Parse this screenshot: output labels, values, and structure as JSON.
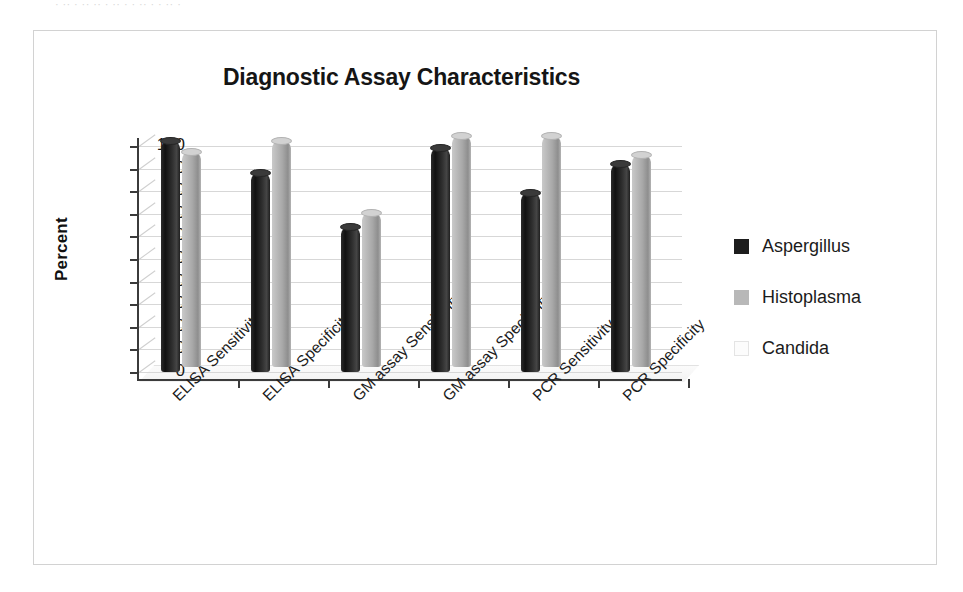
{
  "page": {
    "crumb_text": "· ·· ·  ·· ·· · ·· ·  ·   ·· · ·  ·· ·"
  },
  "chart_data": {
    "type": "bar",
    "title": "Diagnostic Assay Characteristics",
    "xlabel": "",
    "ylabel": "Percent",
    "ylim": [
      0,
      100
    ],
    "yticks": [
      100,
      90,
      80,
      70,
      60,
      50,
      40,
      30,
      20,
      10,
      0
    ],
    "grid": true,
    "legend_position": "right",
    "style": "3d-cylinder",
    "categories": [
      "ELISA Sensitivity",
      "ELISA Specificity",
      "GM assay Sensitivity",
      "GM assay Specificity",
      "PCR Sensitivity",
      "PCR Specificity"
    ],
    "series": [
      {
        "name": "Aspergillus",
        "color": "#1d1d1d",
        "values": [
          102,
          88,
          64,
          99,
          79,
          92
        ]
      },
      {
        "name": "Histoplasma",
        "color": "#b8b8b8",
        "values": [
          95,
          100,
          68,
          102,
          102,
          94
        ]
      },
      {
        "name": "Candida",
        "color": "#fcfcfc",
        "values": [
          0,
          0,
          0,
          0,
          0,
          0
        ]
      }
    ]
  }
}
